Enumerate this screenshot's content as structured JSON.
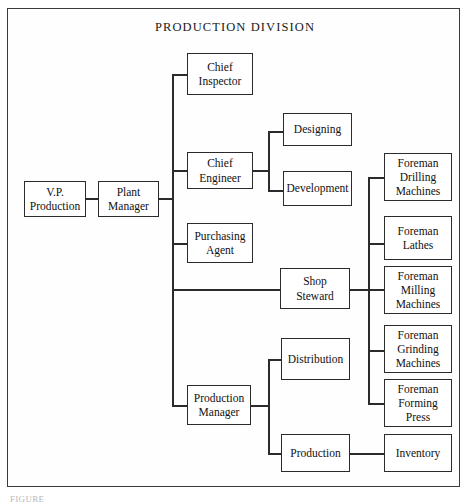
{
  "diagram": {
    "type": "organizational-chart",
    "title": "PRODUCTION  DIVISION",
    "caption_partial": "FIGURE",
    "frame": {
      "border_color": "#3a3a3a"
    },
    "line_color": "#2b2b2b",
    "nodes": {
      "vp_production": "V.P.\nProduction",
      "plant_manager": "Plant\nManager",
      "chief_inspector": "Chief\nInspector",
      "chief_engineer": "Chief\nEngineer",
      "designing": "Designing",
      "development": "Development",
      "purchasing_agent": "Purchasing\nAgent",
      "shop_steward": "Shop\nSteward",
      "production_manager": "Production\nManager",
      "distribution": "Distribution",
      "production": "Production",
      "inventory": "Inventory",
      "foreman_drilling": "Foreman\nDrilling\nMachines",
      "foreman_lathes": "Foreman\nLathes",
      "foreman_milling": "Foreman\nMilling\nMachines",
      "foreman_grinding": "Foreman\nGrinding\nMachines",
      "foreman_forming": "Foreman\nForming\nPress"
    },
    "edges": [
      {
        "from": "vp_production",
        "to": "plant_manager"
      },
      {
        "from": "plant_manager",
        "to": "chief_inspector"
      },
      {
        "from": "plant_manager",
        "to": "chief_engineer"
      },
      {
        "from": "plant_manager",
        "to": "purchasing_agent"
      },
      {
        "from": "plant_manager",
        "to": "shop_steward"
      },
      {
        "from": "plant_manager",
        "to": "production_manager"
      },
      {
        "from": "chief_engineer",
        "to": "designing"
      },
      {
        "from": "chief_engineer",
        "to": "development"
      },
      {
        "from": "shop_steward",
        "to": "foreman_drilling"
      },
      {
        "from": "shop_steward",
        "to": "foreman_lathes"
      },
      {
        "from": "shop_steward",
        "to": "foreman_milling"
      },
      {
        "from": "shop_steward",
        "to": "foreman_grinding"
      },
      {
        "from": "shop_steward",
        "to": "foreman_forming"
      },
      {
        "from": "production_manager",
        "to": "distribution"
      },
      {
        "from": "production_manager",
        "to": "production"
      },
      {
        "from": "production",
        "to": "inventory"
      }
    ]
  }
}
